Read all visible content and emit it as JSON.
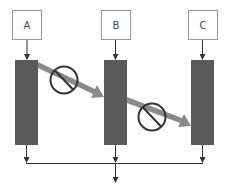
{
  "diagram": {
    "nodes": [
      {
        "id": "A",
        "label": "A"
      },
      {
        "id": "B",
        "label": "B"
      },
      {
        "id": "C",
        "label": "C"
      }
    ],
    "blocked_transfers": [
      {
        "from": "A",
        "to": "B",
        "symbol": "prohibited-icon"
      },
      {
        "from": "B",
        "to": "C",
        "symbol": "prohibited-icon"
      }
    ],
    "colors": {
      "bar": "#5a5a5a",
      "arrow": "#8a8a8a",
      "box_border": "#999999",
      "line": "#333333",
      "circle": "#333333"
    }
  }
}
